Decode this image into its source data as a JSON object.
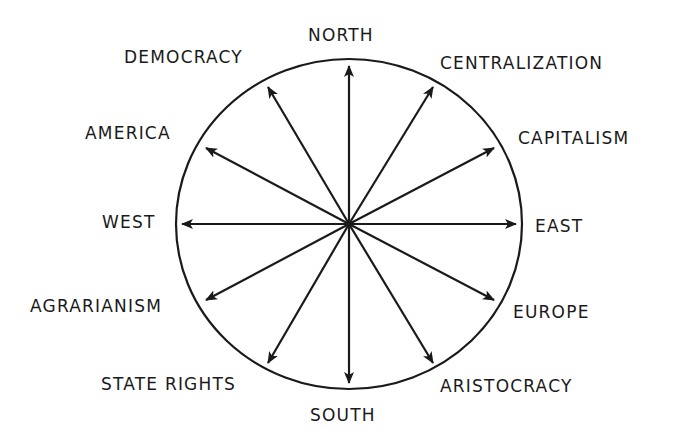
{
  "diagram": {
    "center": [
      349,
      224
    ],
    "rx": 173,
    "ry": 165,
    "stroke": "#1a1a1a",
    "arrows": [
      {
        "name": "north",
        "tip": [
          349,
          66
        ]
      },
      {
        "name": "south",
        "tip": [
          349,
          383
        ]
      },
      {
        "name": "west",
        "tip": [
          182,
          224
        ]
      },
      {
        "name": "east",
        "tip": [
          516,
          224
        ]
      },
      {
        "name": "democracy",
        "tip": [
          268,
          87
        ]
      },
      {
        "name": "centralization",
        "tip": [
          433,
          87
        ]
      },
      {
        "name": "america",
        "tip": [
          206,
          148
        ]
      },
      {
        "name": "capitalism",
        "tip": [
          494,
          148
        ]
      },
      {
        "name": "agrarianism",
        "tip": [
          206,
          300
        ]
      },
      {
        "name": "europe",
        "tip": [
          494,
          300
        ]
      },
      {
        "name": "state-rights",
        "tip": [
          268,
          363
        ]
      },
      {
        "name": "aristocracy",
        "tip": [
          433,
          363
        ]
      }
    ]
  },
  "labels": {
    "north": "NORTH",
    "south": "SOUTH",
    "west": "WEST",
    "east": "EAST",
    "democracy": "DEMOCRACY",
    "centralization": "CENTRALIZATION",
    "america": "AMERICA",
    "capitalism": "CAPITALISM",
    "agrarianism": "AGRARIANISM",
    "europe": "EUROPE",
    "state_rights": "STATE RIGHTS",
    "aristocracy": "ARISTOCRACY"
  }
}
